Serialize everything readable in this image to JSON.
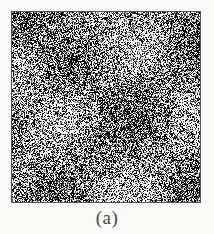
{
  "figure": {
    "panel_label": "(a)",
    "panel_kind": "speckle-noise-image",
    "background_color": "#fbfbfa",
    "border_color": "#565656",
    "caption_color": "#4a4a4a"
  },
  "chart_data": {
    "type": "heatmap",
    "title": "",
    "subtitle": "",
    "xlabel": "",
    "ylabel": "",
    "grid": false,
    "legend": "none",
    "grain_px": 1,
    "grid_cols": 190,
    "grid_rows": 192,
    "value_range": [
      0,
      255
    ],
    "palette": [
      "#000000",
      "#2a2a2a",
      "#555555",
      "#808080",
      "#aaaaaa",
      "#d5d5d5",
      "#ffffff"
    ],
    "level_weights": [
      0.3,
      0.08,
      0.07,
      0.08,
      0.07,
      0.08,
      0.32
    ],
    "mean_level": 128,
    "annotations": [
      {
        "text": "(a)",
        "position": "below-panel-center"
      }
    ]
  }
}
